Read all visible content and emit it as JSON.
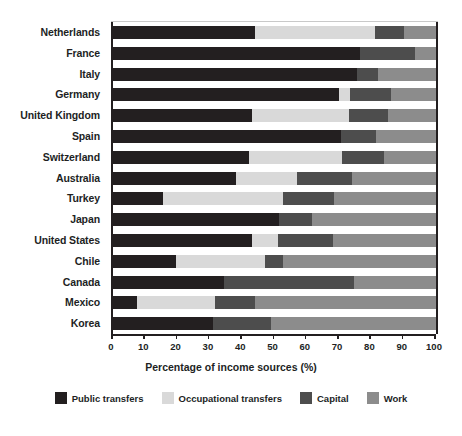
{
  "chart_data": {
    "type": "bar",
    "orientation": "horizontal",
    "stacked": true,
    "title": "",
    "xlabel": "Percentage of income sources (%)",
    "ylabel": "",
    "xlim": [
      0,
      100
    ],
    "xticks": [
      0,
      10,
      20,
      30,
      40,
      50,
      60,
      70,
      80,
      90,
      100
    ],
    "grid": false,
    "legend_position": "bottom",
    "categories": [
      "Netherlands",
      "France",
      "Italy",
      "Germany",
      "United Kingdom",
      "Spain",
      "Switzerland",
      "Australia",
      "Turkey",
      "Japan",
      "United States",
      "Chile",
      "Canada",
      "Mexico",
      "Korea"
    ],
    "series": [
      {
        "name": "Public transfers",
        "color": "#231f20",
        "values": [
          44,
          76.5,
          75.5,
          70,
          43,
          70.5,
          42,
          38,
          15.5,
          51.5,
          43,
          19.5,
          34.5,
          7.5,
          31
        ]
      },
      {
        "name": "Occupational transfers",
        "color": "#d9d9d9",
        "values": [
          37,
          0,
          0,
          3.5,
          30,
          0,
          29,
          19,
          37,
          0,
          8,
          27.5,
          0,
          24,
          0
        ]
      },
      {
        "name": "Capital",
        "color": "#4d4d4d",
        "values": [
          9,
          17,
          6.5,
          12.5,
          12,
          11,
          13,
          17,
          16,
          10,
          17,
          5.5,
          40,
          12.5,
          18
        ]
      },
      {
        "name": "Work",
        "color": "#8c8c8c",
        "values": [
          10,
          6.5,
          18,
          14,
          15,
          18.5,
          16,
          26,
          31.5,
          38.5,
          32,
          47.5,
          25.5,
          56,
          51
        ]
      }
    ]
  },
  "axis": {
    "x_title": "Percentage of income sources (%)",
    "tick_labels": [
      "0",
      "10",
      "20",
      "30",
      "40",
      "50",
      "60",
      "70",
      "80",
      "90",
      "100"
    ]
  },
  "legend": {
    "items": [
      {
        "label": "Public transfers",
        "color": "#231f20"
      },
      {
        "label": "Occupational transfers",
        "color": "#d9d9d9"
      },
      {
        "label": "Capital",
        "color": "#4d4d4d"
      },
      {
        "label": "Work",
        "color": "#8c8c8c"
      }
    ]
  }
}
